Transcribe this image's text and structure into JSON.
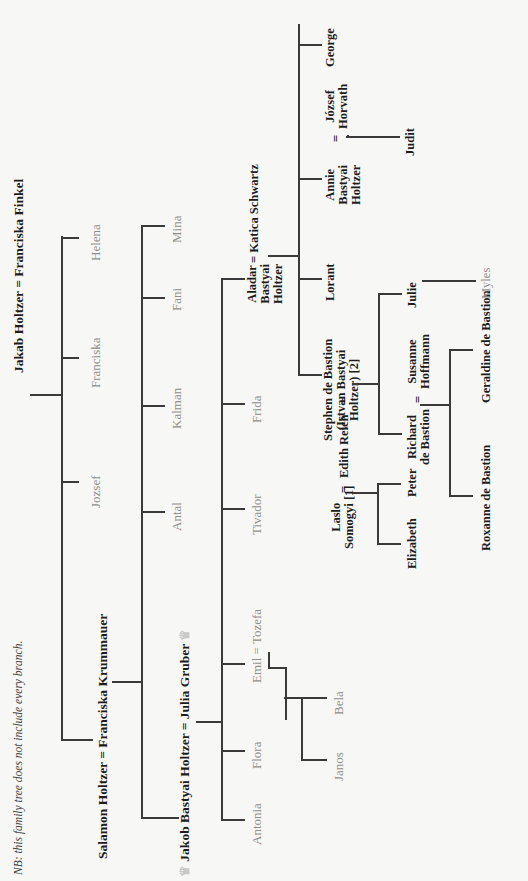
{
  "note": "NB: this family tree does not include every branch.",
  "generation_0": {
    "couple": "Jakab Holtzer = Franciska Finkel"
  },
  "generation_1": {
    "children": [
      {
        "name": "Salamon Holtzer",
        "spouse": "Franciska Krummauer",
        "emphasis": "bold"
      },
      {
        "name": "Jozsef",
        "emphasis": "grey"
      },
      {
        "name": "Franciska",
        "emphasis": "grey"
      },
      {
        "name": "Helena",
        "emphasis": "grey"
      }
    ]
  },
  "generation_2": {
    "children": [
      {
        "name": "Jakob Bastyai Holtzer",
        "spouse": "Julia Gruber",
        "emphasis": "bold",
        "icon": "crown-icon"
      },
      {
        "name": "Antal",
        "emphasis": "grey"
      },
      {
        "name": "Kalman",
        "emphasis": "grey"
      },
      {
        "name": "Fani",
        "emphasis": "grey"
      },
      {
        "name": "Mina",
        "emphasis": "grey"
      }
    ]
  },
  "generation_3": {
    "children": [
      {
        "name": "Antonia",
        "emphasis": "grey"
      },
      {
        "name": "Flora",
        "emphasis": "grey"
      },
      {
        "name": "Emil",
        "spouse": "Tozefa",
        "emphasis": "grey"
      },
      {
        "name": "Tivador",
        "emphasis": "grey"
      },
      {
        "name": "Frida",
        "emphasis": "grey"
      },
      {
        "name": "Aladar Bastyai Holtzer",
        "spouse": "Katica Schwartz",
        "emphasis": "bold"
      }
    ]
  },
  "emil_children": [
    "Janos",
    "Bela"
  ],
  "aladar_family": {
    "name_lines": [
      "Aladar",
      "Bastyai",
      "Holtzer"
    ],
    "spouse": "Katica Schwartz",
    "children": [
      {
        "name_lines": [
          "Stephen de Bastion",
          "(Istvan Bastyai",
          "Holtzer) [2]"
        ]
      },
      {
        "name": "Lorant"
      },
      {
        "name_lines": [
          "Annie",
          "Bastyai",
          "Holtzer"
        ],
        "spouse_lines": [
          "József",
          "Horvath"
        ]
      },
      {
        "name": "George"
      }
    ]
  },
  "edith": {
    "name": "Edith Reich",
    "first_husband_lines": [
      "Laslo",
      "Somogyi [1]"
    ],
    "children_first": [
      "Elizabeth",
      "Peter"
    ],
    "children_second": [
      {
        "name_lines": [
          "Richard",
          "de Bastion"
        ],
        "spouse_lines": [
          "Susanne",
          "Hoffmann"
        ]
      },
      {
        "name": "Julie"
      }
    ]
  },
  "grandchildren": {
    "richard_children": [
      "Roxanne de Bastion",
      "Geraldine de Bastion"
    ],
    "julie_child": "Myles",
    "annie_child": "Judit"
  },
  "symbols": {
    "equals": "=",
    "crown": "♛"
  },
  "colors": {
    "line": "#3a3a3a",
    "bold_text": "#1c1c1c",
    "grey_text": "#8f8f8f",
    "paper": "#f7f7f5"
  }
}
